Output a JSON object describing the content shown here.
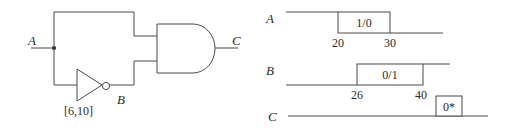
{
  "circuit": {
    "input_label": "A",
    "inverter_output_label": "B",
    "output_label": "C",
    "inverter_delay_label": "[6,10]",
    "gates": [
      {
        "type": "NOT",
        "delay": "[6,10]",
        "input": "A",
        "output": "B"
      },
      {
        "type": "AND",
        "inputs": [
          "A",
          "B"
        ],
        "output": "C"
      }
    ]
  },
  "timing": {
    "signals": [
      {
        "name": "A",
        "box_label": "1/0",
        "times": [
          "20",
          "30"
        ]
      },
      {
        "name": "B",
        "box_label": "0/1",
        "times": [
          "26",
          "40"
        ]
      },
      {
        "name": "C",
        "box_label": "0*",
        "times": []
      }
    ]
  },
  "colors": {
    "line": "#4a4a4a",
    "text": "#2a2a2a",
    "background": "#ffffff"
  }
}
